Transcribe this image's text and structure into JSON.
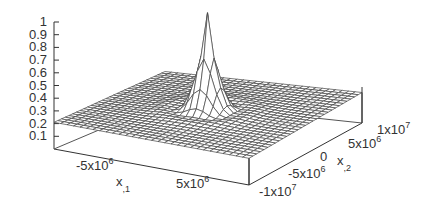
{
  "chart_data": {
    "type": "surface3d",
    "title": "",
    "xlabel": "x_{,1}",
    "ylabel": "x_{,2}",
    "zlabel": "",
    "x_range": [
      -10000000.0,
      10000000.0
    ],
    "y_range": [
      -10000000.0,
      10000000.0
    ],
    "zlim": [
      0,
      1
    ],
    "z_ticks": [
      "0.1",
      "0.2",
      "0.3",
      "0.4",
      "0.5",
      "0.6",
      "0.7",
      "0.8",
      "0.9",
      "1"
    ],
    "x_ticks": [
      "-5x10^6",
      "5x10^6"
    ],
    "y_ticks": [
      "-1x10^7",
      "-5x10^6",
      "0",
      "5x10^6",
      "1x10^7"
    ],
    "base_level": 0.2,
    "peak": {
      "x": 0,
      "y": 0,
      "z": 1.0
    },
    "grid": false,
    "legend": "none"
  },
  "labels": {
    "z_ticks": [
      "0.1",
      "0.2",
      "0.3",
      "0.4",
      "0.5",
      "0.6",
      "0.7",
      "0.8",
      "0.9",
      "1"
    ],
    "x_tick_neg": "-5x10",
    "x_tick_neg_exp": "6",
    "x_tick_pos": "5x10",
    "x_tick_pos_exp": "6",
    "x_label": "x",
    "x_label_sub": ",1",
    "y_tick_m1e7": "-1x10",
    "y_tick_m1e7_exp": "7",
    "y_tick_m5e6": "-5x10",
    "y_tick_m5e6_exp": "6",
    "y_tick_0": "0",
    "y_tick_5e6": "5x10",
    "y_tick_5e6_exp": "6",
    "y_tick_1e7": "1x10",
    "y_tick_1e7_exp": "7",
    "y_label": "x",
    "y_label_sub": ",2"
  }
}
